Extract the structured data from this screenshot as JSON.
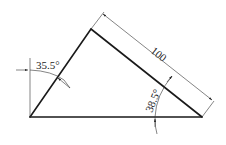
{
  "diagram": {
    "type": "triangle-dimension-drawing",
    "colors": {
      "line": "#1a1a1a",
      "dim": "#333333",
      "background": "#ffffff"
    },
    "vertices": {
      "bottom_left": [
        30,
        117
      ],
      "top": [
        91,
        29
      ],
      "bottom_right": [
        202,
        117
      ]
    },
    "dimensions": {
      "length_label": "100",
      "angle_top_left_label": "35.5°",
      "angle_bottom_right_label": "38.5°"
    }
  }
}
